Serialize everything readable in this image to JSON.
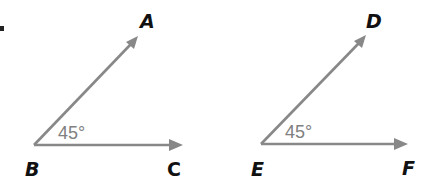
{
  "figure": {
    "marker": ".",
    "angles": [
      {
        "name": "angle-abc",
        "vertex": {
          "label": "B",
          "x": 34,
          "y": 145
        },
        "ray1": {
          "label": "A",
          "tip_x": 137,
          "tip_y": 37
        },
        "ray2": {
          "label": "C",
          "tip_x": 183,
          "tip_y": 145
        },
        "measure": "45°"
      },
      {
        "name": "angle-def",
        "vertex": {
          "label": "E",
          "x": 261,
          "y": 144
        },
        "ray1": {
          "label": "D",
          "tip_x": 366,
          "tip_y": 36
        },
        "ray2": {
          "label": "F",
          "tip_x": 408,
          "tip_y": 144
        },
        "measure": "45°"
      }
    ],
    "colors": {
      "ray": "#888888",
      "label": "#111111",
      "measure": "#808080"
    }
  }
}
